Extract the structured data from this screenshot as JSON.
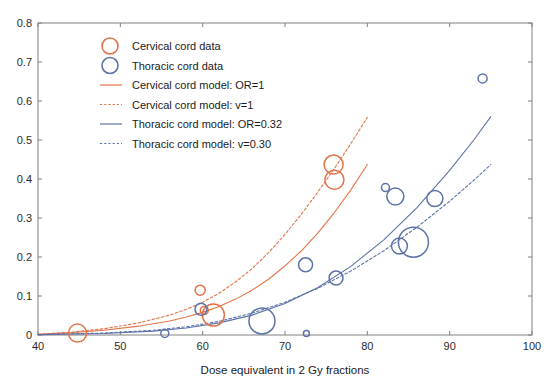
{
  "chart_data": {
    "type": "scatter",
    "title": "",
    "xlabel": "Dose equivalent in 2 Gy fractions",
    "ylabel": "",
    "xlim": [
      40,
      100
    ],
    "ylim": [
      0,
      0.8
    ],
    "xticks": [
      "40",
      "50",
      "60",
      "70",
      "80",
      "90",
      "100"
    ],
    "xtick_values": [
      40,
      50,
      60,
      70,
      80,
      90,
      100
    ],
    "yticks": [
      "0",
      "0.1",
      "0.2",
      "0.3",
      "0.4",
      "0.5",
      "0.6",
      "0.7",
      "0.8"
    ],
    "ytick_values": [
      0,
      0.1,
      0.2,
      0.3,
      0.4,
      0.5,
      0.6,
      0.7,
      0.8
    ],
    "grid": false,
    "legend_position": "upper-left-inside",
    "colors": {
      "cervical": "#E2744B",
      "thoracic": "#5D72A8",
      "axis": "#808080",
      "text": "#1a1a1a"
    },
    "series": [
      {
        "name": "Cervical cord data",
        "kind": "bubble",
        "color": "#E2744B",
        "points": [
          {
            "x": 44.8,
            "y": 0.005,
            "r": 9
          },
          {
            "x": 59.7,
            "y": 0.115,
            "r": 5
          },
          {
            "x": 60.2,
            "y": 0.063,
            "r": 4
          },
          {
            "x": 61.3,
            "y": 0.051,
            "r": 11
          },
          {
            "x": 75.9,
            "y": 0.437,
            "r": 9.5
          },
          {
            "x": 76.0,
            "y": 0.398,
            "r": 9.5
          }
        ]
      },
      {
        "name": "Thoracic cord data",
        "kind": "bubble",
        "color": "#5D72A8",
        "points": [
          {
            "x": 55.4,
            "y": 0.004,
            "r": 4
          },
          {
            "x": 59.8,
            "y": 0.066,
            "r": 6
          },
          {
            "x": 67.2,
            "y": 0.036,
            "r": 13
          },
          {
            "x": 72.6,
            "y": 0.004,
            "r": 3
          },
          {
            "x": 72.5,
            "y": 0.18,
            "r": 7
          },
          {
            "x": 76.2,
            "y": 0.146,
            "r": 7
          },
          {
            "x": 82.2,
            "y": 0.378,
            "r": 4
          },
          {
            "x": 83.4,
            "y": 0.355,
            "r": 8.5
          },
          {
            "x": 83.9,
            "y": 0.228,
            "r": 8
          },
          {
            "x": 85.6,
            "y": 0.238,
            "r": 15
          },
          {
            "x": 88.2,
            "y": 0.35,
            "r": 8
          },
          {
            "x": 94.0,
            "y": 0.658,
            "r": 4.5
          }
        ]
      }
    ],
    "model_curves": [
      {
        "name": "Cervical cord model: OR=1",
        "color": "#E2744B",
        "style": "solid",
        "xrange": [
          40,
          80
        ],
        "points": [
          [
            40,
            0.002
          ],
          [
            44,
            0.006
          ],
          [
            48,
            0.012
          ],
          [
            52,
            0.022
          ],
          [
            56,
            0.036
          ],
          [
            58,
            0.046
          ],
          [
            60,
            0.058
          ],
          [
            62,
            0.073
          ],
          [
            64,
            0.092
          ],
          [
            66,
            0.115
          ],
          [
            68,
            0.143
          ],
          [
            70,
            0.177
          ],
          [
            72,
            0.216
          ],
          [
            74,
            0.262
          ],
          [
            76,
            0.314
          ],
          [
            78,
            0.372
          ],
          [
            80,
            0.437
          ]
        ]
      },
      {
        "name": "Cervical cord model: v=1",
        "color": "#E2744B",
        "style": "dashed",
        "xrange": [
          40,
          80
        ],
        "points": [
          [
            40,
            0.002
          ],
          [
            44,
            0.007
          ],
          [
            48,
            0.016
          ],
          [
            52,
            0.03
          ],
          [
            56,
            0.051
          ],
          [
            58,
            0.066
          ],
          [
            60,
            0.084
          ],
          [
            62,
            0.107
          ],
          [
            64,
            0.136
          ],
          [
            66,
            0.17
          ],
          [
            68,
            0.211
          ],
          [
            70,
            0.258
          ],
          [
            72,
            0.31
          ],
          [
            74,
            0.367
          ],
          [
            76,
            0.427
          ],
          [
            78,
            0.491
          ],
          [
            80,
            0.558
          ]
        ]
      },
      {
        "name": "Thoracic cord model: OR=0.32",
        "color": "#5D72A8",
        "style": "solid",
        "xrange": [
          40,
          95
        ],
        "points": [
          [
            40,
            0.001
          ],
          [
            48,
            0.004
          ],
          [
            54,
            0.01
          ],
          [
            58,
            0.018
          ],
          [
            62,
            0.031
          ],
          [
            66,
            0.051
          ],
          [
            70,
            0.081
          ],
          [
            74,
            0.122
          ],
          [
            78,
            0.176
          ],
          [
            82,
            0.244
          ],
          [
            86,
            0.326
          ],
          [
            90,
            0.422
          ],
          [
            93,
            0.502
          ],
          [
            95,
            0.56
          ]
        ]
      },
      {
        "name": "Thoracic cord model: v=0.30",
        "color": "#5D72A8",
        "style": "dashed",
        "xrange": [
          40,
          95
        ],
        "points": [
          [
            40,
            0.001
          ],
          [
            48,
            0.005
          ],
          [
            54,
            0.012
          ],
          [
            58,
            0.021
          ],
          [
            62,
            0.035
          ],
          [
            66,
            0.056
          ],
          [
            70,
            0.084
          ],
          [
            74,
            0.12
          ],
          [
            78,
            0.164
          ],
          [
            82,
            0.216
          ],
          [
            86,
            0.276
          ],
          [
            90,
            0.343
          ],
          [
            93,
            0.398
          ],
          [
            95,
            0.437
          ]
        ]
      }
    ]
  },
  "legend": {
    "items": [
      {
        "label": "Cervical cord data",
        "marker": "circle",
        "color": "#E2744B"
      },
      {
        "label": "Thoracic cord data",
        "marker": "circle",
        "color": "#5D72A8"
      },
      {
        "label": "Cervical cord model: OR=1",
        "marker": "line-solid",
        "color": "#E2744B"
      },
      {
        "label": "Cervical cord model: v=1",
        "marker": "line-dashed",
        "color": "#E2744B"
      },
      {
        "label": "Thoracic cord model: OR=0.32",
        "marker": "line-solid",
        "color": "#5D72A8"
      },
      {
        "label": "Thoracic cord model: v=0.30",
        "marker": "line-dashed",
        "color": "#5D72A8"
      }
    ]
  }
}
